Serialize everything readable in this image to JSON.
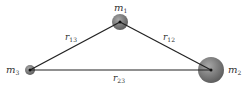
{
  "diagram": {
    "bodies": [
      {
        "id": "m1",
        "label": "m",
        "sub": "1",
        "cx": 120,
        "cy": 22,
        "r": 8
      },
      {
        "id": "m2",
        "label": "m",
        "sub": "2",
        "cx": 211,
        "cy": 70,
        "r": 13
      },
      {
        "id": "m3",
        "label": "m",
        "sub": "3",
        "cx": 30,
        "cy": 70,
        "r": 5
      }
    ],
    "edges": [
      {
        "id": "r13",
        "label": "r",
        "sub": "13"
      },
      {
        "id": "r12",
        "label": "r",
        "sub": "12"
      },
      {
        "id": "r23",
        "label": "r",
        "sub": "23"
      }
    ],
    "colors": {
      "body": "#7a7a7a",
      "line": "#222222",
      "text": "#333333"
    }
  }
}
